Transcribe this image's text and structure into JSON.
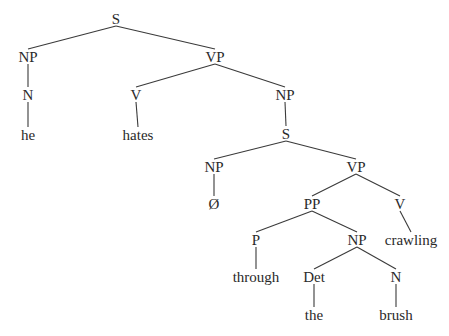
{
  "diagram": {
    "type": "syntax-tree",
    "colors": {
      "text": "#2a2a2a",
      "edge": "#3a3a3a",
      "background": "#ffffff"
    },
    "nodes": [
      {
        "id": "S1",
        "label": "S",
        "x": 116,
        "y": 19
      },
      {
        "id": "NP1",
        "label": "NP",
        "x": 28,
        "y": 57
      },
      {
        "id": "N1",
        "label": "N",
        "x": 28,
        "y": 95
      },
      {
        "id": "he",
        "label": "he",
        "x": 28,
        "y": 135
      },
      {
        "id": "VP1",
        "label": "VP",
        "x": 215,
        "y": 57
      },
      {
        "id": "V1",
        "label": "V",
        "x": 136,
        "y": 95
      },
      {
        "id": "hates",
        "label": "hates",
        "x": 138,
        "y": 135
      },
      {
        "id": "NP2",
        "label": "NP",
        "x": 285,
        "y": 95
      },
      {
        "id": "S2",
        "label": "S",
        "x": 286,
        "y": 134
      },
      {
        "id": "NP3",
        "label": "NP",
        "x": 214,
        "y": 167
      },
      {
        "id": "null",
        "label": "Ø",
        "x": 214,
        "y": 204
      },
      {
        "id": "VP2",
        "label": "VP",
        "x": 356,
        "y": 167
      },
      {
        "id": "PP",
        "label": "PP",
        "x": 312,
        "y": 204
      },
      {
        "id": "V2",
        "label": "V",
        "x": 400,
        "y": 204
      },
      {
        "id": "crawling",
        "label": "crawling",
        "x": 411,
        "y": 240
      },
      {
        "id": "P",
        "label": "P",
        "x": 256,
        "y": 240
      },
      {
        "id": "NP4",
        "label": "NP",
        "x": 357,
        "y": 240
      },
      {
        "id": "through",
        "label": "through",
        "x": 256,
        "y": 277
      },
      {
        "id": "Det",
        "label": "Det",
        "x": 314,
        "y": 277
      },
      {
        "id": "N2",
        "label": "N",
        "x": 396,
        "y": 277
      },
      {
        "id": "the",
        "label": "the",
        "x": 314,
        "y": 315
      },
      {
        "id": "brush",
        "label": "brush",
        "x": 396,
        "y": 315
      }
    ],
    "edges": [
      [
        "S1",
        "NP1"
      ],
      [
        "S1",
        "VP1"
      ],
      [
        "NP1",
        "N1"
      ],
      [
        "N1",
        "he"
      ],
      [
        "VP1",
        "V1"
      ],
      [
        "VP1",
        "NP2"
      ],
      [
        "V1",
        "hates"
      ],
      [
        "NP2",
        "S2"
      ],
      [
        "S2",
        "NP3"
      ],
      [
        "S2",
        "VP2"
      ],
      [
        "NP3",
        "null"
      ],
      [
        "VP2",
        "PP"
      ],
      [
        "VP2",
        "V2"
      ],
      [
        "V2",
        "crawling"
      ],
      [
        "PP",
        "P"
      ],
      [
        "PP",
        "NP4"
      ],
      [
        "P",
        "through"
      ],
      [
        "NP4",
        "Det"
      ],
      [
        "NP4",
        "N2"
      ],
      [
        "Det",
        "the"
      ],
      [
        "N2",
        "brush"
      ]
    ]
  }
}
